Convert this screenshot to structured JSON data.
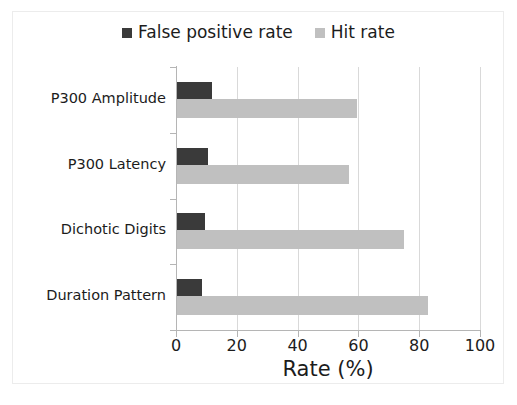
{
  "chart_data": {
    "type": "bar",
    "orientation": "horizontal",
    "title": "",
    "xlabel": "Rate (%)",
    "ylabel": "",
    "xlim": [
      0,
      100
    ],
    "xticks": [
      "0",
      "20",
      "40",
      "60",
      "80",
      "100"
    ],
    "xtick_values": [
      0,
      20,
      40,
      60,
      80,
      100
    ],
    "grid": true,
    "legend_position": "top-center",
    "categories": [
      "P300 Amplitude",
      "P300 Latency",
      "Dichotic Digits",
      "Duration Pattern"
    ],
    "series": [
      {
        "name": "False positive rate",
        "color": "#3a3a3a",
        "values": [
          12,
          10.5,
          9.5,
          8.5
        ]
      },
      {
        "name": "Hit rate",
        "color": "#c0c0c0",
        "values": [
          59.5,
          57,
          75,
          83
        ]
      }
    ]
  },
  "legend": {
    "entries": [
      {
        "label": "False positive rate",
        "color": "#3a3a3a"
      },
      {
        "label": "Hit rate",
        "color": "#c0c0c0"
      }
    ]
  },
  "colors": {
    "false_positive_rate": "#3a3a3a",
    "hit_rate": "#c0c0c0",
    "gridline": "#d9d9d9",
    "axis": "#b5b5b5",
    "frame_border": "#ececec",
    "text": "#1c1c1c",
    "background": "#ffffff"
  }
}
